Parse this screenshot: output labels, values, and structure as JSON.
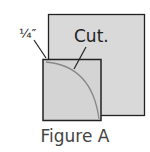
{
  "figure": {
    "caption": "Figure A",
    "labels": {
      "seam_allowance": "¼″",
      "cut": "Cut."
    },
    "colors": {
      "fill": "#d9d9d9",
      "stroke": "#222222",
      "arc": "#888888"
    }
  }
}
